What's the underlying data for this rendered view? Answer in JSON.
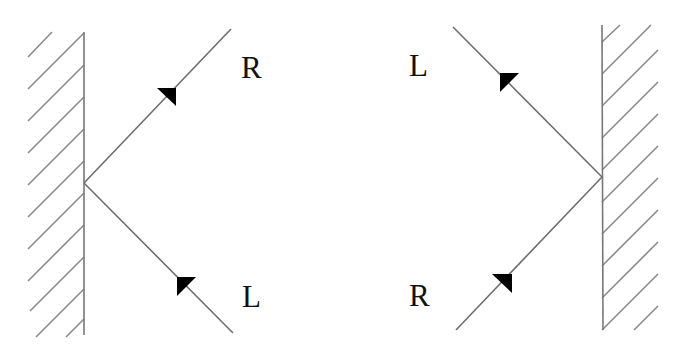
{
  "diagram": {
    "colors": {
      "line": "#6e6e6e",
      "wall": "#777777",
      "arrow": "#000000",
      "text": "#111111",
      "background": "#ffffff"
    },
    "panels": [
      {
        "id": "left-panel",
        "wall": {
          "x": 84,
          "y1": 32,
          "y2": 335,
          "hatch_side": "left"
        },
        "vertex": {
          "x": 84,
          "y": 183
        },
        "rays": [
          {
            "name": "outgoing-ray",
            "end": {
              "x": 231,
              "y": 29
            },
            "direction": "away-from-wall",
            "label": "R"
          },
          {
            "name": "incoming-ray",
            "end": {
              "x": 233,
              "y": 333
            },
            "direction": "toward-wall",
            "label": "L"
          }
        ],
        "labels": [
          {
            "text": "R",
            "x": 241,
            "y": 52
          },
          {
            "text": "L",
            "x": 242,
            "y": 281
          }
        ]
      },
      {
        "id": "right-panel",
        "wall": {
          "x": 602,
          "y1": 25,
          "y2": 330,
          "hatch_side": "right"
        },
        "vertex": {
          "x": 602,
          "y": 177
        },
        "rays": [
          {
            "name": "outgoing-ray",
            "end": {
              "x": 453,
              "y": 27
            },
            "direction": "away-from-wall",
            "label": "L"
          },
          {
            "name": "incoming-ray",
            "end": {
              "x": 456,
              "y": 330
            },
            "direction": "toward-wall",
            "label": "R"
          }
        ],
        "labels": [
          {
            "text": "L",
            "x": 409,
            "y": 50
          },
          {
            "text": "R",
            "x": 409,
            "y": 280
          }
        ]
      }
    ]
  }
}
